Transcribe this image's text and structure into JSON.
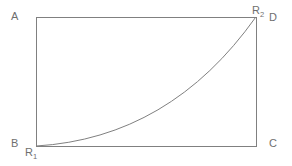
{
  "figure": {
    "type": "geometric-diagram",
    "background_color": "#ffffff",
    "stroke_color": "#808080",
    "label_color": "#6f6f6f",
    "canvas": {
      "width": 292,
      "height": 166
    },
    "rectangle": {
      "left": 36,
      "top": 17,
      "right": 256,
      "bottom": 146,
      "corners": {
        "top_left": [
          36,
          17
        ],
        "top_right": [
          256,
          17
        ],
        "bottom_right": [
          256,
          146
        ],
        "bottom_left": [
          36,
          146
        ]
      }
    },
    "curve": {
      "kind": "convex-increasing",
      "from": [
        36,
        146
      ],
      "to": [
        256,
        17
      ],
      "control_point": [
        170,
        138
      ],
      "sample_points": [
        [
          36,
          146
        ],
        [
          60,
          138
        ],
        [
          95,
          127
        ],
        [
          130,
          113
        ],
        [
          146,
          105
        ],
        [
          190,
          74
        ],
        [
          210,
          57
        ],
        [
          256,
          17
        ]
      ]
    },
    "vertex_labels": {
      "top_left": "A",
      "top_right": "D",
      "bottom_right": "C",
      "bottom_left": "B"
    },
    "region_labels": {
      "upper": {
        "base": "R",
        "subscript": "2"
      },
      "lower": {
        "base": "R",
        "subscript": "1"
      }
    }
  }
}
